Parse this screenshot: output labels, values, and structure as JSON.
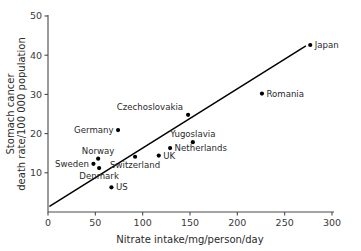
{
  "chart_data": {
    "type": "scatter",
    "title": "",
    "xlabel": "Nitrate intake/mg/person/day",
    "ylabel_line1": "Stomach cancer",
    "ylabel_line2": "death rate/100 000 population",
    "xlim": [
      0,
      300
    ],
    "ylim": [
      0,
      50
    ],
    "xticks": [
      0,
      50,
      100,
      150,
      200,
      250,
      300
    ],
    "yticks": [
      10,
      20,
      30,
      40,
      50
    ],
    "grid": false,
    "legend": "none",
    "points": [
      {
        "label": "Sweden",
        "x": 48,
        "y": 12.3,
        "label_pos": "left"
      },
      {
        "label": "Norway",
        "x": 53,
        "y": 13.6,
        "label_pos": "above"
      },
      {
        "label": "Denmark",
        "x": 54,
        "y": 11.2,
        "label_pos": "below"
      },
      {
        "label": "US",
        "x": 67,
        "y": 6.3,
        "label_pos": "right"
      },
      {
        "label": "Germany",
        "x": 74,
        "y": 20.9,
        "label_pos": "left"
      },
      {
        "label": "Switzerland",
        "x": 92,
        "y": 14.1,
        "label_pos": "below"
      },
      {
        "label": "UK",
        "x": 117,
        "y": 14.4,
        "label_pos": "right"
      },
      {
        "label": "Netherlands",
        "x": 129,
        "y": 16.3,
        "label_pos": "right"
      },
      {
        "label": "Czechoslovakia",
        "x": 148,
        "y": 24.8,
        "label_pos": "above-left"
      },
      {
        "label": "Yugoslavia",
        "x": 153,
        "y": 17.8,
        "label_pos": "above"
      },
      {
        "label": "Romania",
        "x": 226,
        "y": 30.2,
        "label_pos": "right"
      },
      {
        "label": "Japan",
        "x": 277,
        "y": 42.6,
        "label_pos": "right"
      }
    ],
    "fit_line": {
      "name": "regression-line",
      "x_start": 2,
      "y_start": 1.5,
      "x_end": 272,
      "y_end": 42.3
    }
  }
}
